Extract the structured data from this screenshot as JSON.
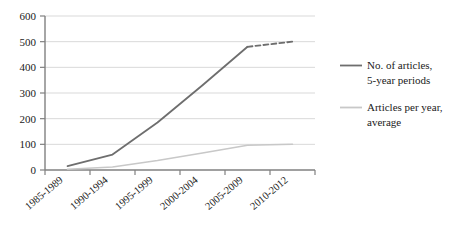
{
  "chart_data": {
    "type": "line",
    "title": "",
    "xlabel": "",
    "ylabel": "",
    "categories": [
      "1985-1989",
      "1990-1994",
      "1995-1999",
      "2000-2004",
      "2005-2009",
      "2010-2012"
    ],
    "ylim": [
      0,
      600
    ],
    "yticks": [
      0,
      100,
      200,
      300,
      400,
      500,
      600
    ],
    "ytick_labels": [
      "0",
      "100",
      "200",
      "300",
      "400",
      "500",
      "600"
    ],
    "grid": true,
    "grid_axis": "y",
    "legend_position": "right",
    "series": [
      {
        "name": "No. of articles, 5-year periods",
        "legend_label_line1": "No. of articles,",
        "legend_label_line2": "5-year periods",
        "color": "#6e6e6e",
        "values": [
          15,
          60,
          185,
          330,
          480,
          500
        ],
        "dashed_from_index": 4,
        "style": "solid-with-dashed-projection"
      },
      {
        "name": "Articles per year, average",
        "legend_label_line1": "Articles per year,",
        "legend_label_line2": "average",
        "color": "#c8c8c8",
        "values": [
          3,
          12,
          37,
          66,
          96,
          100
        ],
        "style": "solid"
      }
    ]
  },
  "colors": {
    "background": "#ffffff",
    "grid": "#d9d9d9",
    "axis": "#808080",
    "series_dark": "#6e6e6e",
    "series_light": "#c8c8c8",
    "text": "#1a1a1a"
  }
}
